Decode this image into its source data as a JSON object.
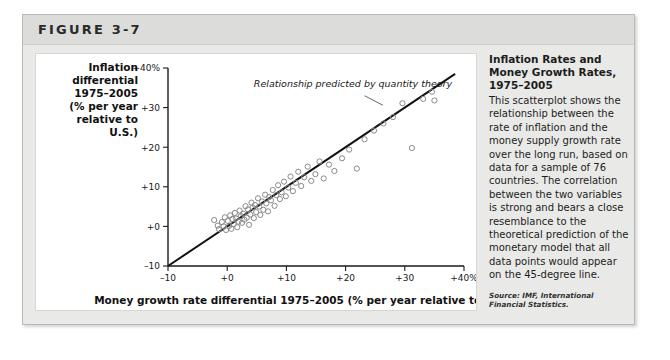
{
  "figure": {
    "label": "FIGURE 3-7"
  },
  "sidebar": {
    "title": "Inflation Rates and Money Growth Rates, 1975–2005",
    "body": "This scatterplot shows the relationship between the rate of inflation and the money supply growth rate over the long run, based on data for a sample of 76 countries. The correlation between the two variables is strong and bears a close resemblance to the theoretical prediction of the monetary model that all data points would appear on the 45-degree line.",
    "source": "Source: IMF, International Financial Statistics."
  },
  "chart_data": {
    "type": "scatter",
    "title": "Inflation Rates and Money Growth Rates, 1975–2005",
    "xlabel": "Money growth rate differential 1975–2005 (% per year relative to U.S.)",
    "ylabel": "Inflation differential 1975–2005 (% per year relative to U.S.)",
    "ylabel_lines": [
      "Inflation",
      "differential",
      "1975–2005",
      "(% per year",
      "relative to",
      "U.S.)"
    ],
    "xlim": [
      -10,
      40
    ],
    "ylim": [
      -10,
      40
    ],
    "xticks": [
      -10,
      0,
      10,
      20,
      30,
      40
    ],
    "xticklabels": [
      "–10",
      "+0",
      "+10",
      "+20",
      "+30",
      "+40%"
    ],
    "yticks": [
      -10,
      0,
      10,
      20,
      30,
      40
    ],
    "yticklabels": [
      "–10",
      "+0",
      "+10",
      "+20",
      "+30",
      "+40%"
    ],
    "grid": false,
    "legend": null,
    "annotations": [
      {
        "text": "Relationship predicted by quantity theory",
        "x": 4.5,
        "y": 35.2,
        "pointer_from": [
          23.2,
          33.0
        ],
        "pointer_to": [
          26.3,
          30.6
        ]
      }
    ],
    "reference_line": {
      "name": "45-degree line",
      "from": [
        -10,
        -10
      ],
      "to": [
        38.5,
        38.5
      ],
      "color": "#111111"
    },
    "marker": {
      "shape": "open-circle",
      "radius": 2.6,
      "stroke": "#8a8a8a"
    },
    "points": [
      [
        -2.2,
        1.6
      ],
      [
        -1.6,
        0.2
      ],
      [
        -1.4,
        -0.7
      ],
      [
        -0.9,
        1.1
      ],
      [
        -0.6,
        0.0
      ],
      [
        -0.4,
        2.3
      ],
      [
        -0.2,
        -0.9
      ],
      [
        0.1,
        1.4
      ],
      [
        0.3,
        0.1
      ],
      [
        0.5,
        2.8
      ],
      [
        0.7,
        -0.6
      ],
      [
        0.9,
        1.9
      ],
      [
        1.1,
        0.6
      ],
      [
        1.3,
        3.4
      ],
      [
        1.5,
        2.0
      ],
      [
        1.7,
        -0.2
      ],
      [
        1.9,
        1.2
      ],
      [
        2.1,
        4.0
      ],
      [
        2.3,
        2.6
      ],
      [
        2.5,
        0.9
      ],
      [
        2.7,
        3.2
      ],
      [
        2.9,
        1.7
      ],
      [
        3.1,
        5.1
      ],
      [
        3.3,
        2.2
      ],
      [
        3.5,
        4.3
      ],
      [
        3.7,
        0.4
      ],
      [
        3.9,
        3.0
      ],
      [
        4.1,
        6.0
      ],
      [
        4.3,
        4.8
      ],
      [
        4.5,
        2.1
      ],
      [
        4.7,
        5.4
      ],
      [
        4.9,
        3.6
      ],
      [
        5.2,
        7.1
      ],
      [
        5.4,
        5.0
      ],
      [
        5.6,
        2.9
      ],
      [
        5.9,
        6.3
      ],
      [
        6.1,
        4.2
      ],
      [
        6.4,
        8.0
      ],
      [
        6.6,
        5.8
      ],
      [
        6.9,
        3.8
      ],
      [
        7.1,
        7.4
      ],
      [
        7.4,
        6.6
      ],
      [
        7.7,
        9.2
      ],
      [
        8.0,
        5.2
      ],
      [
        8.3,
        7.9
      ],
      [
        8.6,
        10.4
      ],
      [
        8.9,
        6.9
      ],
      [
        9.2,
        8.6
      ],
      [
        9.6,
        11.3
      ],
      [
        9.9,
        7.6
      ],
      [
        10.3,
        9.8
      ],
      [
        10.7,
        12.6
      ],
      [
        11.1,
        8.9
      ],
      [
        11.6,
        11.0
      ],
      [
        12.0,
        13.8
      ],
      [
        12.5,
        10.2
      ],
      [
        13.0,
        12.4
      ],
      [
        13.6,
        15.1
      ],
      [
        14.2,
        11.5
      ],
      [
        14.9,
        13.2
      ],
      [
        15.6,
        16.4
      ],
      [
        16.3,
        12.1
      ],
      [
        17.2,
        15.6
      ],
      [
        18.1,
        14.0
      ],
      [
        19.4,
        17.2
      ],
      [
        20.6,
        19.4
      ],
      [
        21.9,
        14.6
      ],
      [
        23.2,
        22.0
      ],
      [
        24.8,
        24.2
      ],
      [
        26.4,
        26.0
      ],
      [
        28.0,
        27.6
      ],
      [
        29.6,
        31.1
      ],
      [
        31.2,
        19.8
      ],
      [
        33.1,
        32.2
      ],
      [
        34.6,
        34.0
      ],
      [
        35.0,
        31.8
      ]
    ]
  }
}
